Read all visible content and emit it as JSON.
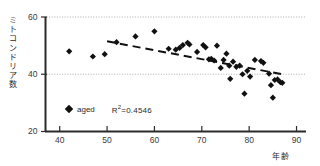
{
  "chart_data": {
    "type": "scatter",
    "title": "",
    "subtitle": "",
    "xlabel": "年齢",
    "ylabel": "ミトコンドリア数",
    "xlim": [
      37,
      92
    ],
    "ylim": [
      20,
      60
    ],
    "xticks": [
      40,
      50,
      60,
      70,
      80,
      90
    ],
    "yticks": [
      20,
      40,
      60
    ],
    "gridlines": {
      "y": [
        40,
        60
      ],
      "x": [],
      "style": "dotted"
    },
    "legend": {
      "position": "inside-bottom-left",
      "entries": [
        {
          "label": "aged",
          "marker": "diamond",
          "color": "#111111"
        }
      ],
      "annotation": "R²=0.4546",
      "r_squared": 0.4546
    },
    "trendline": {
      "style": "dashed",
      "color": "#111111",
      "x": [
        50,
        87
      ],
      "y": [
        51.5,
        40.0
      ]
    },
    "series": [
      {
        "name": "aged",
        "marker": "diamond",
        "color": "#111111",
        "points": [
          [
            42.0,
            48.0
          ],
          [
            47.0,
            46.2
          ],
          [
            49.5,
            47.0
          ],
          [
            52.0,
            51.2
          ],
          [
            56.0,
            53.2
          ],
          [
            60.0,
            55.0
          ],
          [
            63.0,
            48.9
          ],
          [
            64.5,
            48.6
          ],
          [
            65.3,
            49.2
          ],
          [
            66.0,
            50.2
          ],
          [
            67.0,
            51.0
          ],
          [
            67.4,
            50.4
          ],
          [
            69.0,
            47.8
          ],
          [
            70.3,
            50.2
          ],
          [
            70.8,
            49.4
          ],
          [
            71.5,
            45.2
          ],
          [
            72.0,
            45.4
          ],
          [
            72.6,
            44.8
          ],
          [
            73.2,
            50.0
          ],
          [
            74.0,
            42.2
          ],
          [
            74.6,
            45.0
          ],
          [
            75.2,
            47.2
          ],
          [
            75.8,
            43.0
          ],
          [
            76.0,
            38.4
          ],
          [
            76.6,
            44.4
          ],
          [
            77.3,
            42.6
          ],
          [
            78.0,
            43.0
          ],
          [
            78.6,
            40.0
          ],
          [
            79.0,
            33.2
          ],
          [
            79.6,
            41.2
          ],
          [
            80.2,
            39.2
          ],
          [
            81.2,
            45.0
          ],
          [
            82.5,
            44.6
          ],
          [
            83.0,
            44.0
          ],
          [
            84.2,
            40.2
          ],
          [
            84.6,
            36.2
          ],
          [
            85.0,
            31.8
          ],
          [
            85.4,
            38.0
          ],
          [
            86.0,
            38.2
          ],
          [
            86.6,
            37.2
          ],
          [
            87.0,
            37.0
          ]
        ]
      }
    ]
  }
}
